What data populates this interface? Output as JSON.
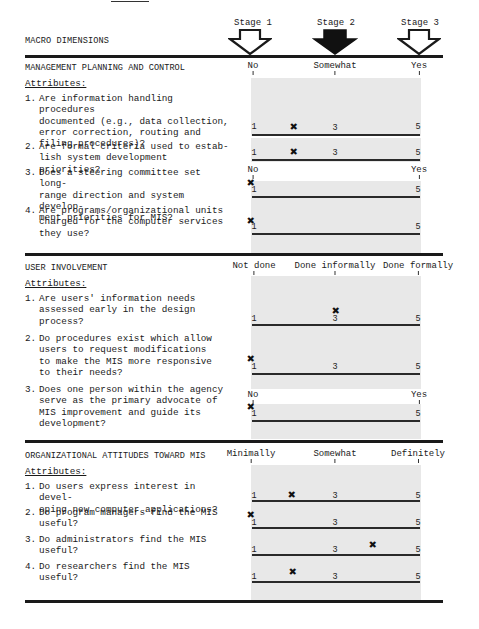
{
  "page": {
    "macro_dimensions_label": "MACRO DIMENSIONS",
    "stages": [
      {
        "label": "Stage 1",
        "filled": false
      },
      {
        "label": "Stage 2",
        "filled": true
      },
      {
        "label": "Stage 3",
        "filled": false
      }
    ]
  },
  "sections": [
    {
      "title": "MANAGEMENT PLANNING AND CONTROL",
      "attributes_label": "Attributes:",
      "scale_labels": [
        "No",
        "Somewhat",
        "Yes"
      ],
      "questions": [
        {
          "number": "1.",
          "text": "Are information handling procedures documented (e.g., data collection, error correction, routing and filing procedures)?",
          "scale": [
            "1",
            "3",
            "5"
          ],
          "rating": 2
        },
        {
          "number": "2.",
          "text": "Are formal criteria used to establish system development priorities?",
          "scale": [
            "1",
            "3",
            "5"
          ],
          "rating": 2
        },
        {
          "number": "3.",
          "text": "Does a steering committee set long-range direction and system development priorities for MIS?",
          "scale_labels": [
            "No",
            "Yes"
          ],
          "scale": [
            "1",
            "5"
          ],
          "rating": 1
        },
        {
          "number": "4.",
          "text": "Are programs/organizational units charged for the computer services they use?",
          "scale": [
            "1",
            "5"
          ],
          "rating": 1
        }
      ]
    },
    {
      "title": "USER INVOLVEMENT",
      "attributes_label": "Attributes:",
      "scale_labels": [
        "Not done",
        "Done informally",
        "Done formally"
      ],
      "questions": [
        {
          "number": "1.",
          "text": "Are users' information needs assessed early in the design process?",
          "scale": [
            "1",
            "3",
            "5"
          ],
          "rating": 3
        },
        {
          "number": "2.",
          "text": "Do procedures exist which allow users to request modifications to make the MIS more responsive to their needs?",
          "scale": [
            "1",
            "3",
            "5"
          ],
          "rating": 1
        },
        {
          "number": "3.",
          "text": "Does one person within the agency serve as the primary advocate of MIS improvement and guide its development?",
          "scale_labels": [
            "No",
            "Yes"
          ],
          "scale": [
            "1",
            "5"
          ],
          "rating": 1
        }
      ]
    },
    {
      "title": "ORGANIZATIONAL ATTITUDES TOWARD MIS",
      "attributes_label": "Attributes:",
      "scale_labels": [
        "Minimally",
        "Somewhat",
        "Definitely"
      ],
      "questions": [
        {
          "number": "1.",
          "text": "Do users express interest in developing new computer applications?",
          "scale": [
            "1",
            "3",
            "5"
          ],
          "rating": 2
        },
        {
          "number": "2.",
          "text": "Do program managers find the MIS useful?",
          "scale": [
            "1",
            "3",
            "5"
          ],
          "rating": 1
        },
        {
          "number": "3.",
          "text": "Do administrators find the MIS useful?",
          "scale": [
            "1",
            "3",
            "5"
          ],
          "rating": 4
        },
        {
          "number": "4.",
          "text": "Do researchers find the MIS useful?",
          "scale": [
            "1",
            "3",
            "5"
          ],
          "rating": 2
        }
      ]
    }
  ],
  "labels": {
    "s1": {
      "title": "MANAGEMENT PLANNING AND CONTROL",
      "attributes": "Attributes:",
      "no": "No",
      "somewhat": "Somewhat",
      "yes": "Yes",
      "q1n": "1.",
      "q1": "Are information handling procedures\ndocumented (e.g., data collection,\nerror correction, routing and\nfiling procedures)?",
      "q2n": "2.",
      "q2": "Are formal criteria used to estab-\nlish system development priorities?",
      "q3n": "3.",
      "q3": "Does a steering committee set long-\nrange direction and system develop-\nment priorities for MIS?",
      "q4n": "4.",
      "q4": "Are programs/organizational units\ncharged for the computer services\nthey use?",
      "no2": "No",
      "yes2": "Yes"
    },
    "s2": {
      "title": "USER INVOLVEMENT",
      "attributes": "Attributes:",
      "notdone": "Not done",
      "informal": "Done informally",
      "formal": "Done formally",
      "q1n": "1.",
      "q1": "Are users' information needs\nassessed early in the design\nprocess?",
      "q2n": "2.",
      "q2": "Do procedures exist which allow\nusers to request modifications\nto make the MIS more responsive\nto their needs?",
      "q3n": "3.",
      "q3": "Does one person within the agency\nserve as the primary advocate of\nMIS improvement and guide its\ndevelopment?",
      "no": "No",
      "yes": "Yes"
    },
    "s3": {
      "title": "ORGANIZATIONAL ATTITUDES TOWARD MIS",
      "attributes": "Attributes:",
      "min": "Minimally",
      "some": "Somewhat",
      "def": "Definitely",
      "q1n": "1.",
      "q1": "Do users express interest in devel-\noping new computer applications?",
      "q2n": "2.",
      "q2": "Do program managers find the MIS\nuseful?",
      "q3n": "3.",
      "q3": "Do administrators find the MIS\nuseful?",
      "q4n": "4.",
      "q4": "Do researchers find the MIS\nuseful?"
    },
    "one": "1",
    "three": "3",
    "five": "5",
    "mark": "✖"
  }
}
